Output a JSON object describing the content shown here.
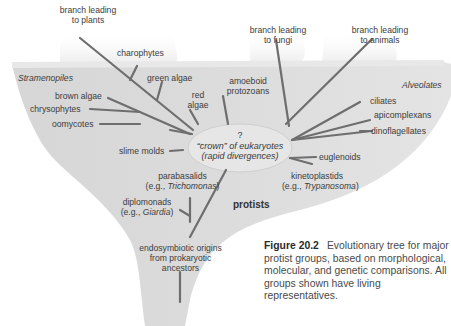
{
  "branches_top": {
    "plants": [
      "branch leading",
      "to plants"
    ],
    "fungi": [
      "branch leading",
      "to fungi"
    ],
    "animals": [
      "branch leading",
      "to animals"
    ]
  },
  "groups": {
    "stramenopiles": "Stramenopiles",
    "alveolates": "Alveolates"
  },
  "labels": {
    "charophytes": "charophytes",
    "green_algae": "green algae",
    "red_algae": [
      "red",
      "algae"
    ],
    "brown_algae": "brown algae",
    "chrysophytes": "chrysophytes",
    "oomycotes": "oomycotes",
    "slime_molds": "slime molds",
    "amoeboid": [
      "amoeboid",
      "protozoans"
    ],
    "ciliates": "ciliates",
    "apicomplexans": "apicomplexans",
    "dinoflagellates": "dinoflagellates",
    "euglenoids": "euglenoids",
    "kinetoplastids": [
      "kinetoplastids",
      "(e.g., ",
      "Trypanosoma",
      ")"
    ],
    "parabasalids": [
      "parabasalids",
      "(e.g., ",
      "Trichomonas",
      ")"
    ],
    "diplomonads": [
      "diplomonads",
      "(e.g., ",
      "Giardia",
      ")"
    ],
    "endosymbiotic": [
      "endosymbiotic origins",
      "from prokaryotic",
      "ancestors"
    ]
  },
  "crown": {
    "question": "?",
    "line1": "“crown” of eukaryotes",
    "line2": "(rapid divergences)"
  },
  "protists": "protists",
  "caption": {
    "figure": "Figure 20.2",
    "text": "Evolutionary tree for major protist groups, based on morphological, molecular, and genetic comparisons. All groups shown have living representatives."
  },
  "colors": {
    "funnel": "#d8d8d8",
    "funnel_light": "#e6e6e6",
    "branch": "#6e6e6e",
    "crown_ellipse": "#e4e4e4"
  }
}
